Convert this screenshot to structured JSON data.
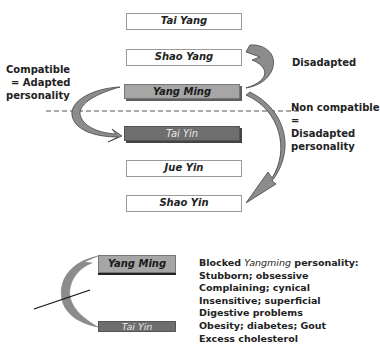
{
  "top_diagram": {
    "levels": [
      {
        "label": "Tai Yang",
        "style": "white"
      },
      {
        "label": "Shao Yang",
        "style": "white"
      },
      {
        "label": "Yang Ming",
        "style": "light"
      },
      {
        "label": "Tai Yin",
        "style": "dark"
      },
      {
        "label": "Jue Yin",
        "style": "white"
      },
      {
        "label": "Shao Yin",
        "style": "white"
      }
    ],
    "left_annotation": [
      "Compatible",
      "= Adapted",
      "personality"
    ],
    "right_top_annotation": "Disadapted",
    "right_mid_annotation": [
      "Non compatible =",
      "Disadapted",
      "personality"
    ]
  },
  "bottom_diagram": {
    "box_top": "Yang Ming",
    "box_bottom": "Tai Yin",
    "list_title_prefix": "Blocked ",
    "list_title_italic": "Yangming",
    "list_title_suffix": " personality:",
    "items": [
      "Stubborn; obsessive",
      "Complaining; cynical",
      "Insensitive; superficial",
      "Digestive problems",
      "Obesity; diabetes; Gout",
      "Excess cholesterol"
    ]
  },
  "colors": {
    "arrow_fill": "#8c8c8c",
    "light_box": "#a6a6a6",
    "dark_box": "#6e6e6e"
  }
}
